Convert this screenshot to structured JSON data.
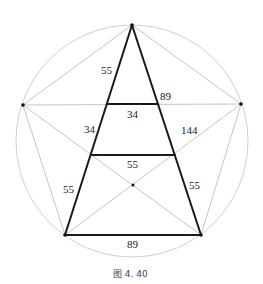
{
  "figure": {
    "caption": "图 4. 40",
    "colors": {
      "thin_line": "#b5b5b5",
      "thick_line": "#1a1a1a",
      "text": "#222222"
    },
    "points": {
      "top": [
        132,
        25
      ],
      "left": [
        23,
        105
      ],
      "right": [
        241,
        104
      ],
      "bottom_left": [
        65,
        235
      ],
      "bottom_right": [
        201,
        235
      ],
      "center": [
        133,
        185
      ]
    },
    "circle": {
      "cx": 132,
      "cy": 141,
      "r": 116
    },
    "labels": {
      "top_left_side": "55",
      "top_right_side": "89",
      "upper_bar": "34",
      "mid_left_side": "34",
      "mid_right_side": "144",
      "lower_bar": "55",
      "bottom_left_side": "55",
      "bottom_right_side": "55",
      "base": "89"
    }
  }
}
